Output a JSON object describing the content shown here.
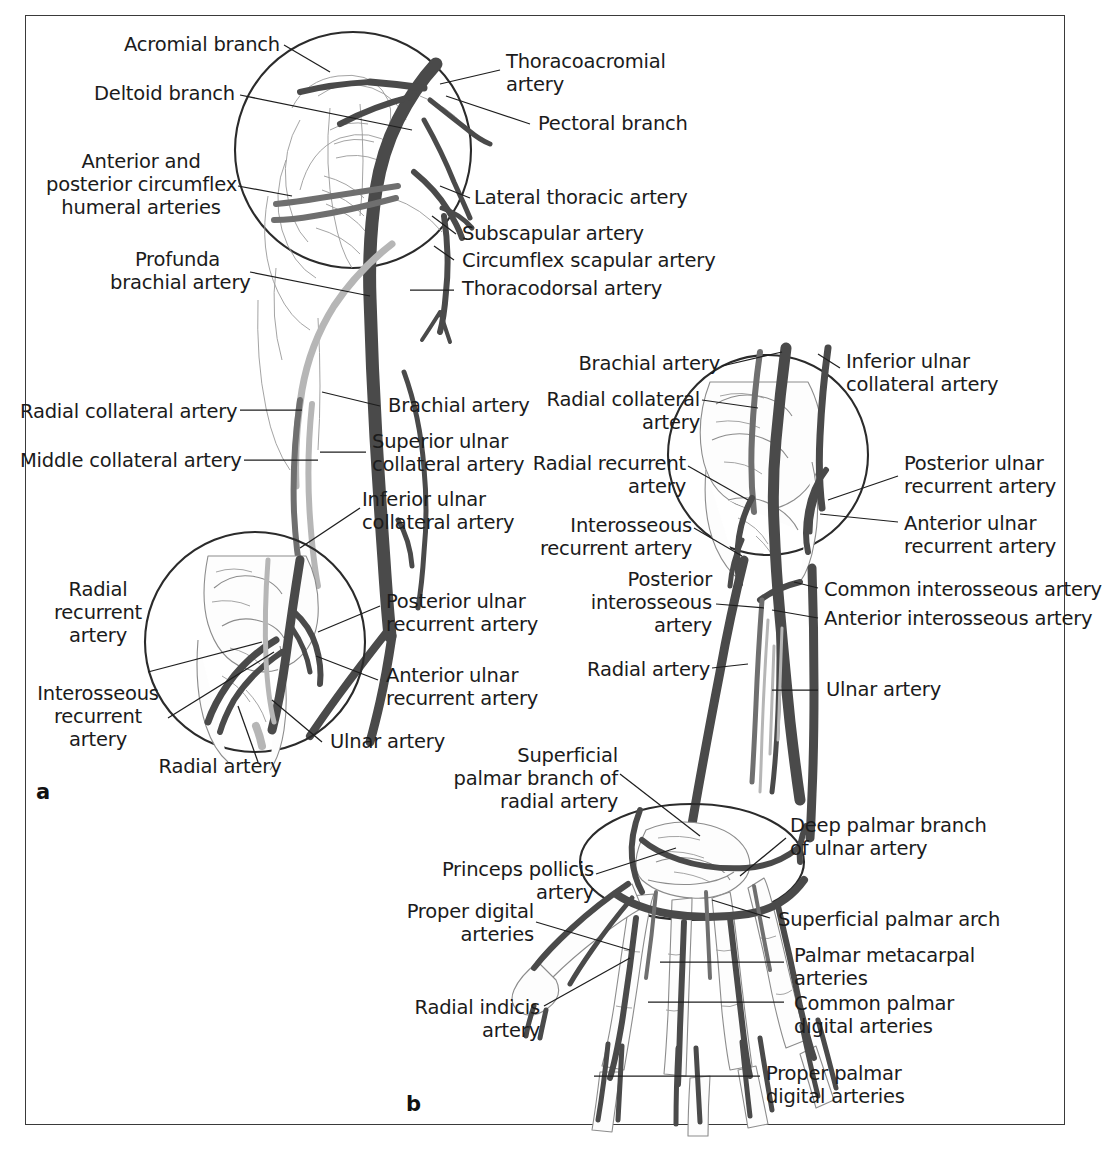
{
  "figure": {
    "panels": [
      {
        "id": "a",
        "caption": "a"
      },
      {
        "id": "b",
        "caption": "b"
      }
    ]
  },
  "colors": {
    "artery_dark": "#4a4a4a",
    "artery_mid": "#6f6f6f",
    "artery_light": "#b6b6b6",
    "bone_outline": "#8c8c8c",
    "leader_line": "#1e1e1e",
    "frame": "#3a3a3a",
    "text": "#1b1b1b",
    "background": "#ffffff"
  },
  "panel_a": {
    "id": "a",
    "description": "Anterior view of right upper limb arteries with magnified shoulder and elbow insets",
    "labels_left": [
      {
        "key": "acromial-branch",
        "text": "Acromial branch"
      },
      {
        "key": "deltoid-branch",
        "text": "Deltoid branch"
      },
      {
        "key": "circumflex-humeral",
        "text": "Anterior and\nposterior circumflex\nhumeral arteries"
      },
      {
        "key": "profunda-brachial",
        "text": "Profunda\nbrachial artery"
      },
      {
        "key": "radial-collateral",
        "text": "Radial collateral artery"
      },
      {
        "key": "middle-collateral",
        "text": "Middle collateral artery"
      },
      {
        "key": "radial-recurrent",
        "text": "Radial\nrecurrent\nartery"
      },
      {
        "key": "interosseous-recurrent",
        "text": "Interosseous\nrecurrent\nartery"
      },
      {
        "key": "radial-artery",
        "text": "Radial artery"
      }
    ],
    "labels_right": [
      {
        "key": "thoracoacromial",
        "text": "Thoracoacromial\nartery"
      },
      {
        "key": "pectoral-branch",
        "text": "Pectoral branch"
      },
      {
        "key": "lateral-thoracic",
        "text": "Lateral thoracic artery"
      },
      {
        "key": "subscapular",
        "text": "Subscapular artery"
      },
      {
        "key": "circumflex-scapular",
        "text": "Circumflex scapular artery"
      },
      {
        "key": "thoracodorsal",
        "text": "Thoracodorsal artery"
      },
      {
        "key": "brachial-artery",
        "text": "Brachial artery"
      },
      {
        "key": "superior-ulnar-collateral",
        "text": "Superior ulnar\ncollateral artery"
      },
      {
        "key": "inferior-ulnar-collateral",
        "text": "Inferior ulnar\ncollateral artery"
      },
      {
        "key": "posterior-ulnar-recurrent",
        "text": "Posterior ulnar\nrecurrent artery"
      },
      {
        "key": "anterior-ulnar-recurrent",
        "text": "Anterior ulnar\nrecurrent artery"
      },
      {
        "key": "ulnar-artery",
        "text": "Ulnar artery"
      }
    ]
  },
  "panel_b": {
    "id": "b",
    "description": "Anterior view of right forearm and hand arteries with magnified elbow and wrist insets",
    "labels_left": [
      {
        "key": "brachial-artery",
        "text": "Brachial artery"
      },
      {
        "key": "radial-collateral",
        "text": "Radial collateral\nartery"
      },
      {
        "key": "radial-recurrent",
        "text": "Radial recurrent\nartery"
      },
      {
        "key": "interosseous-recurrent",
        "text": "Interosseous\nrecurrent artery"
      },
      {
        "key": "posterior-interosseous",
        "text": "Posterior\ninterosseous\nartery"
      },
      {
        "key": "radial-artery",
        "text": "Radial artery"
      },
      {
        "key": "superficial-palmar-branch-radial",
        "text": "Superficial\npalmar branch of\nradial artery"
      },
      {
        "key": "princeps-pollicis",
        "text": "Princeps pollicis\nartery"
      },
      {
        "key": "proper-digital",
        "text": "Proper digital\narteries"
      },
      {
        "key": "radial-indicis",
        "text": "Radial indicis\nartery"
      }
    ],
    "labels_right": [
      {
        "key": "inferior-ulnar-collateral",
        "text": "Inferior ulnar\ncollateral artery"
      },
      {
        "key": "posterior-ulnar-recurrent",
        "text": "Posterior ulnar\nrecurrent artery"
      },
      {
        "key": "anterior-ulnar-recurrent",
        "text": "Anterior ulnar\nrecurrent artery"
      },
      {
        "key": "common-interosseous",
        "text": "Common interosseous artery"
      },
      {
        "key": "anterior-interosseous",
        "text": "Anterior interosseous artery"
      },
      {
        "key": "ulnar-artery",
        "text": "Ulnar artery"
      },
      {
        "key": "deep-palmar-branch-ulnar",
        "text": "Deep palmar branch\nof ulnar artery"
      },
      {
        "key": "superficial-palmar-arch",
        "text": "Superficial palmar arch"
      },
      {
        "key": "palmar-metacarpal",
        "text": "Palmar metacarpal\narteries"
      },
      {
        "key": "common-palmar-digital",
        "text": "Common palmar\ndigital arteries"
      },
      {
        "key": "proper-palmar-digital",
        "text": "Proper palmar\ndigital arteries"
      }
    ]
  }
}
